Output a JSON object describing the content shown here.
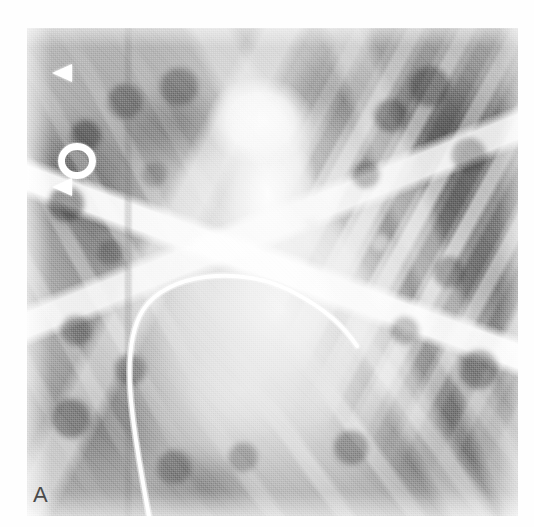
{
  "figure": {
    "panel_label": "A",
    "modality": "chest-radiograph-angiogram",
    "background_color": "#ffffff",
    "plate_base_color": "#c3c3c3",
    "marker_color": "#ffffff",
    "label_color": "#4a4a4a"
  },
  "markers": [
    {
      "id": "marker-upper",
      "shape": "arrowhead-left",
      "x": 52,
      "y": 64
    },
    {
      "id": "marker-middle",
      "shape": "ring",
      "x": 58,
      "y": 143
    },
    {
      "id": "marker-lower",
      "shape": "arrowhead-left",
      "x": 52,
      "y": 178
    }
  ],
  "anatomy": {
    "mediastinum": "aortic arch and great vessels",
    "catheter": "curved radiopaque catheter",
    "ribs_right": "oblique rib shadows",
    "ribs_left": "oblique rib shadows",
    "lung_fields": "mottled parenchymal opacities"
  }
}
